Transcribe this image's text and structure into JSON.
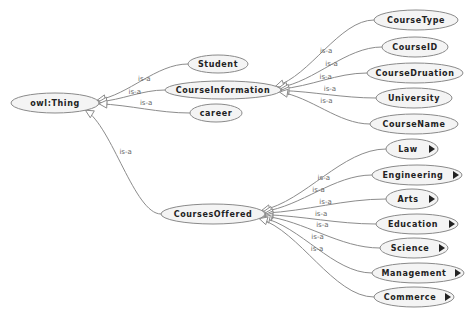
{
  "diagram": {
    "type": "ontology-graph",
    "edge_label": "is-a",
    "nodes": [
      {
        "id": "owl_thing",
        "label": "owl:Thing",
        "x": 55,
        "y": 103,
        "rx": 44,
        "ry": 10,
        "expandable": false
      },
      {
        "id": "student",
        "label": "Student",
        "x": 218,
        "y": 64,
        "rx": 30,
        "ry": 9,
        "expandable": false
      },
      {
        "id": "courseinformation",
        "label": "CourseInformation",
        "x": 223,
        "y": 90,
        "rx": 58,
        "ry": 9,
        "expandable": false
      },
      {
        "id": "career",
        "label": "career",
        "x": 216,
        "y": 113,
        "rx": 26,
        "ry": 9,
        "expandable": false
      },
      {
        "id": "coursesoffered",
        "label": "CoursesOffered",
        "x": 213,
        "y": 214,
        "rx": 52,
        "ry": 10,
        "expandable": false
      },
      {
        "id": "coursetype",
        "label": "CourseType",
        "x": 416,
        "y": 20,
        "rx": 42,
        "ry": 10,
        "expandable": false
      },
      {
        "id": "courseid",
        "label": "CourseID",
        "x": 415,
        "y": 47,
        "rx": 33,
        "ry": 10,
        "expandable": false
      },
      {
        "id": "coursedruation",
        "label": "CourseDruation",
        "x": 415,
        "y": 73,
        "rx": 48,
        "ry": 10,
        "expandable": false
      },
      {
        "id": "university",
        "label": "University",
        "x": 414,
        "y": 98,
        "rx": 38,
        "ry": 10,
        "expandable": false
      },
      {
        "id": "coursename",
        "label": "CourseName",
        "x": 414,
        "y": 124,
        "rx": 44,
        "ry": 10,
        "expandable": false
      },
      {
        "id": "law",
        "label": "Law",
        "x": 412,
        "y": 149,
        "rx": 26,
        "ry": 10,
        "expandable": true
      },
      {
        "id": "engineering",
        "label": "Engineering",
        "x": 417,
        "y": 175,
        "rx": 45,
        "ry": 10,
        "expandable": true
      },
      {
        "id": "arts",
        "label": "Arts",
        "x": 412,
        "y": 199,
        "rx": 26,
        "ry": 10,
        "expandable": true
      },
      {
        "id": "education",
        "label": "Education",
        "x": 417,
        "y": 224,
        "rx": 41,
        "ry": 10,
        "expandable": true
      },
      {
        "id": "science",
        "label": "Science",
        "x": 414,
        "y": 248,
        "rx": 34,
        "ry": 10,
        "expandable": true
      },
      {
        "id": "management",
        "label": "Management",
        "x": 418,
        "y": 273,
        "rx": 46,
        "ry": 10,
        "expandable": true
      },
      {
        "id": "commerce",
        "label": "Commerce",
        "x": 414,
        "y": 297,
        "rx": 40,
        "ry": 10,
        "expandable": true
      }
    ],
    "edges": [
      {
        "from": "student",
        "to": "owl_thing",
        "label": "is-a"
      },
      {
        "from": "courseinformation",
        "to": "owl_thing",
        "label": "is-a"
      },
      {
        "from": "career",
        "to": "owl_thing",
        "label": "is-a"
      },
      {
        "from": "coursesoffered",
        "to": "owl_thing",
        "label": "is-a"
      },
      {
        "from": "coursetype",
        "to": "courseinformation",
        "label": "is-a"
      },
      {
        "from": "courseid",
        "to": "courseinformation",
        "label": "is-a"
      },
      {
        "from": "coursedruation",
        "to": "courseinformation",
        "label": "is-a"
      },
      {
        "from": "university",
        "to": "courseinformation",
        "label": "is-a"
      },
      {
        "from": "coursename",
        "to": "courseinformation",
        "label": "is-a"
      },
      {
        "from": "law",
        "to": "coursesoffered",
        "label": "is-a"
      },
      {
        "from": "engineering",
        "to": "coursesoffered",
        "label": "is-a"
      },
      {
        "from": "arts",
        "to": "coursesoffered",
        "label": "is-a"
      },
      {
        "from": "education",
        "to": "coursesoffered",
        "label": "is-a"
      },
      {
        "from": "science",
        "to": "coursesoffered",
        "label": "is-a"
      },
      {
        "from": "management",
        "to": "coursesoffered",
        "label": "is-a"
      },
      {
        "from": "commerce",
        "to": "coursesoffered",
        "label": "is-a"
      }
    ]
  }
}
